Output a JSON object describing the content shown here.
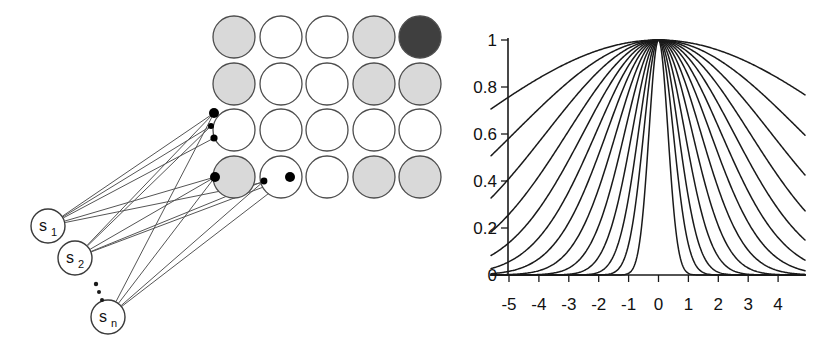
{
  "figure": {
    "panels": [
      {
        "id": "network-diagram",
        "name": "source-to-grid-connection-diagram",
        "grid": {
          "rows": 4,
          "cols": 5,
          "radius": 21,
          "x_centers": [
            234,
            281,
            327,
            374,
            420
          ],
          "y_centers": [
            37,
            84,
            130,
            177
          ],
          "stroke": "#4d4d4d",
          "fills": [
            [
              "#d9d9d9",
              "#ffffff",
              "#ffffff",
              "#d9d9d9",
              "#3f3f3f"
            ],
            [
              "#d9d9d9",
              "#ffffff",
              "#ffffff",
              "#d9d9d9",
              "#d9d9d9"
            ],
            [
              "#ffffff",
              "#ffffff",
              "#ffffff",
              "#ffffff",
              "#ffffff"
            ],
            [
              "#d9d9d9",
              "#ffffff",
              "#ffffff",
              "#d9d9d9",
              "#d9d9d9"
            ]
          ],
          "fill_labels": [
            [
              "light",
              "empty",
              "empty",
              "light",
              "dark"
            ],
            [
              "light",
              "empty",
              "empty",
              "light",
              "light"
            ],
            [
              "empty",
              "empty",
              "empty",
              "empty",
              "empty"
            ],
            [
              "light",
              "empty",
              "empty",
              "light",
              "light"
            ]
          ]
        },
        "terminals": [
          {
            "name": "terminal-r3c1-top",
            "x": 214,
            "y": 113,
            "r": 5.0
          },
          {
            "name": "terminal-r3c1-mid",
            "x": 211,
            "y": 126,
            "r": 3.0
          },
          {
            "name": "terminal-r3c1-low",
            "x": 214,
            "y": 138,
            "r": 3.6
          },
          {
            "name": "terminal-r4c1-left",
            "x": 215,
            "y": 177,
            "r": 5.0
          },
          {
            "name": "terminal-r4c2-left",
            "x": 264,
            "y": 181,
            "r": 3.4
          },
          {
            "name": "terminal-r4c2-right",
            "x": 290,
            "y": 177,
            "r": 5.0
          }
        ],
        "sources": [
          {
            "name": "source-node-s1",
            "label": "s",
            "sub": "1",
            "cx": 48,
            "cy": 226,
            "r": 17
          },
          {
            "name": "source-node-s2",
            "label": "s",
            "sub": "2",
            "cx": 75,
            "cy": 258,
            "r": 17
          },
          {
            "name": "source-node-sn",
            "label": "s",
            "sub": "n",
            "cx": 108,
            "cy": 317,
            "r": 17
          }
        ],
        "ellipsis_dots": [
          {
            "x": 96,
            "y": 284,
            "r": 2.2
          },
          {
            "x": 99,
            "y": 292,
            "r": 2.0
          },
          {
            "x": 102,
            "y": 300,
            "r": 2.0
          }
        ],
        "edges": [
          {
            "from": "source-node-s1",
            "to": "terminal-r3c1-top"
          },
          {
            "from": "source-node-s1",
            "to": "terminal-r3c1-mid"
          },
          {
            "from": "source-node-s1",
            "to": "terminal-r3c1-low"
          },
          {
            "from": "source-node-s1",
            "to": "terminal-r4c1-left"
          },
          {
            "from": "source-node-s1",
            "to": "terminal-r4c2-right"
          },
          {
            "from": "source-node-s2",
            "to": "terminal-r3c1-top"
          },
          {
            "from": "source-node-s2",
            "to": "terminal-r3c1-mid"
          },
          {
            "from": "source-node-s2",
            "to": "terminal-r4c1-left"
          },
          {
            "from": "source-node-s2",
            "to": "terminal-r4c2-left"
          },
          {
            "from": "source-node-s2",
            "to": "terminal-r4c2-right"
          },
          {
            "from": "source-node-sn",
            "to": "terminal-r3c1-top"
          },
          {
            "from": "source-node-sn",
            "to": "terminal-r4c1-left"
          },
          {
            "from": "source-node-sn",
            "to": "terminal-r4c2-left"
          },
          {
            "from": "source-node-sn",
            "to": "terminal-r4c2-right"
          }
        ],
        "edge_stroke": "#555555"
      }
    ]
  },
  "chart_data": {
    "type": "line",
    "title": "",
    "xlabel": "",
    "ylabel": "",
    "xlim": [
      -5.6,
      4.9
    ],
    "ylim": [
      0,
      1.06
    ],
    "grid": false,
    "legend": "none",
    "x_ticks": [
      -5,
      -4,
      -3,
      -2,
      -1,
      0,
      1,
      2,
      3,
      4
    ],
    "x_tick_labels": [
      "-5",
      "-4",
      "-3",
      "-2",
      "-1",
      "0",
      "1",
      "2",
      "3",
      "4"
    ],
    "y_ticks": [
      0,
      0.2,
      0.4,
      0.6,
      0.8,
      1
    ],
    "y_tick_labels": [
      "0",
      "0.2",
      "0.4",
      "0.6",
      "0.8",
      "1"
    ],
    "series_form": "exp(-(x/sigma)^2)",
    "series": [
      {
        "name": "sigma-0.45",
        "sigma": 0.45
      },
      {
        "name": "sigma-0.70",
        "sigma": 0.7
      },
      {
        "name": "sigma-0.95",
        "sigma": 0.95
      },
      {
        "name": "sigma-1.25",
        "sigma": 1.25
      },
      {
        "name": "sigma-1.60",
        "sigma": 1.6
      },
      {
        "name": "sigma-2.00",
        "sigma": 2.0
      },
      {
        "name": "sigma-2.45",
        "sigma": 2.45
      },
      {
        "name": "sigma-2.95",
        "sigma": 2.95
      },
      {
        "name": "sigma-3.55",
        "sigma": 3.55
      },
      {
        "name": "sigma-4.30",
        "sigma": 4.3
      },
      {
        "name": "sigma-5.30",
        "sigma": 5.3
      },
      {
        "name": "sigma-6.80",
        "sigma": 6.8
      },
      {
        "name": "sigma-9.50",
        "sigma": 9.5
      }
    ],
    "stroke": "#1a1a1a",
    "axis_color": "#1a1a1a",
    "geometry": {
      "x_axis_y": 275,
      "y_axis_x": 508,
      "x_at_minus5": 509,
      "px_per_unit_x": 29.9,
      "y_at_0": 275,
      "y_at_1": 40,
      "tick_len": 7,
      "x_tick_label_y": 310,
      "y_tick_label_x": 497
    }
  }
}
